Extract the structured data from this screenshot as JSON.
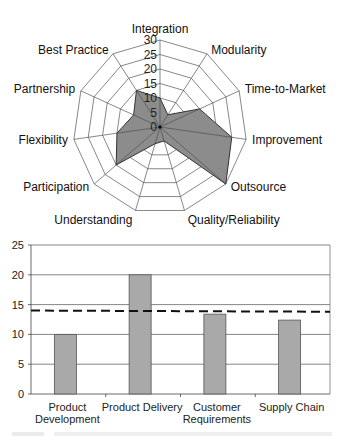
{
  "chart_data": [
    {
      "type": "radar",
      "title": "",
      "axes": [
        "Integration",
        "Modularity",
        "Time-to-Market",
        "Improvement",
        "Outsource",
        "Quality/Reliability",
        "Understanding",
        "Participation",
        "Flexibility",
        "Partnership",
        "Best Practice"
      ],
      "values": [
        10,
        5,
        15,
        25,
        30,
        5,
        6,
        20,
        15,
        10,
        15
      ],
      "scale_ticks": [
        "0",
        "5",
        "10",
        "15",
        "20",
        "25",
        "30"
      ],
      "range": [
        0,
        30
      ],
      "grid": true,
      "fill_color": "#8c8c8c",
      "line_color": "#333333"
    },
    {
      "type": "bar",
      "title": "",
      "xlabel": "",
      "ylabel": "",
      "categories": [
        "Product Development",
        "Product Delivery",
        "Customer Requirements",
        "Supply Chain"
      ],
      "category_label_lines": [
        [
          "Product",
          "Development"
        ],
        [
          "Product Delivery"
        ],
        [
          "Customer",
          "Requirements"
        ],
        [
          "Supply Chain"
        ]
      ],
      "values": [
        10,
        20,
        13.4,
        12.4
      ],
      "yticks": [
        "0",
        "5",
        "10",
        "15",
        "20",
        "25"
      ],
      "ylim": [
        0,
        25
      ],
      "grid": true,
      "reference_line": {
        "style": "dashed",
        "value_left": 14,
        "value_right": 13.8
      },
      "bar_color": "#a9a9a9",
      "legend": null
    }
  ]
}
